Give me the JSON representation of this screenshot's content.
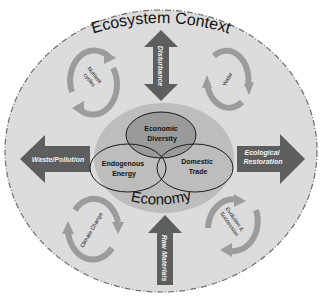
{
  "diagram": {
    "title": "Ecosystem Context",
    "economy_label": "Economy",
    "venn": [
      {
        "id": "economic-diversity",
        "line1": "Economic",
        "line2": "Diversity"
      },
      {
        "id": "endogenous-energy",
        "line1": "Endogenous",
        "line2": "Energy"
      },
      {
        "id": "domestic-trade",
        "line1": "Domestic",
        "line2": "Trade"
      }
    ],
    "arrows": {
      "top": "Disturbance",
      "left": "Waste/Pollution",
      "right_line1": "Ecological",
      "right_line2": "Restoration",
      "bottom": "Raw Materials"
    },
    "cycles": {
      "top_left_line1": "Nutrient",
      "top_left_line2": "cycles",
      "top_right": "Water",
      "bottom_left": "Climate Change",
      "bottom_right_line1": "Evolution &",
      "bottom_right_line2": "Succession"
    },
    "colors": {
      "background": "#ffffff",
      "outer_fill": "#dcdcdc",
      "outer_stroke": "#6e6e6e",
      "economy_fill": "#bdbdbd",
      "diversity_fill": "#9a9a9a",
      "arrow_fill": "#5e5e5e",
      "cycle_fill": "#9c9c9c",
      "text": "#111111"
    }
  }
}
